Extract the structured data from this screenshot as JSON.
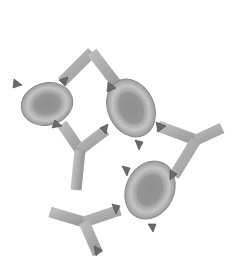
{
  "image": {
    "subject": "antibody-mediated agglutination of red blood cells",
    "background": "#ffffff",
    "colors": {
      "antibody": "#a9a9a9",
      "antibody_edge": "#8a8a8a",
      "cell_fill": "#b5b5b5",
      "cell_center": "#8f8f8f",
      "antigen": "#6a6a6a"
    },
    "cells": [
      {
        "cx": 47,
        "cy": 104,
        "rx": 26,
        "ry": 21,
        "rotate": -15
      },
      {
        "cx": 131,
        "cy": 108,
        "rx": 23,
        "ry": 30,
        "rotate": -25
      },
      {
        "cx": 150,
        "cy": 190,
        "rx": 24,
        "ry": 30,
        "rotate": 25
      }
    ]
  }
}
